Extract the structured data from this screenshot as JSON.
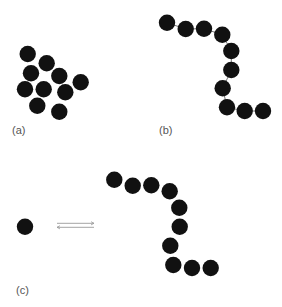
{
  "figure": {
    "panels": [
      {
        "id": "a",
        "label": "(a)",
        "label_pos": [
          12,
          124
        ],
        "description": "cluster of 10 particles",
        "particles": [
          [
            27.7,
            54
          ],
          [
            46.7,
            63.3
          ],
          [
            31,
            73.3
          ],
          [
            59.3,
            76
          ],
          [
            80.7,
            82.3
          ],
          [
            25,
            89.3
          ],
          [
            43.7,
            89.3
          ],
          [
            65.3,
            92.3
          ],
          [
            37.3,
            105.7
          ],
          [
            59.3,
            111.7
          ]
        ],
        "bonds": false
      },
      {
        "id": "b",
        "label": "(b)",
        "label_pos": [
          159,
          124
        ],
        "description": "chain of 10 linked particles",
        "particles": [
          [
            167,
            22.7
          ],
          [
            185.7,
            29
          ],
          [
            204,
            28.7
          ],
          [
            222.3,
            34.7
          ],
          [
            231.3,
            51
          ],
          [
            231.3,
            70
          ],
          [
            222.7,
            88.3
          ],
          [
            227,
            107.3
          ],
          [
            244.7,
            111
          ],
          [
            263,
            111
          ]
        ],
        "bonds": true
      },
      {
        "id": "c",
        "label": "(c)",
        "label_pos": [
          16,
          284
        ],
        "description": "single particle in equilibrium with a chain of 10 particles",
        "single_particle": [
          25,
          226.7
        ],
        "equilibrium_arrows": {
          "x1": 57,
          "x2": 94,
          "y_forward": 223.3,
          "y_reverse": 227.3
        },
        "particles": [
          [
            114.3,
            179.7
          ],
          [
            132.7,
            185.7
          ],
          [
            151.3,
            185.3
          ],
          [
            169.7,
            191.3
          ],
          [
            179.3,
            207.7
          ],
          [
            179.7,
            226.7
          ],
          [
            170.3,
            245.7
          ],
          [
            173.3,
            265
          ],
          [
            192,
            268
          ],
          [
            210.7,
            268
          ]
        ],
        "bonds": false
      }
    ],
    "particle_radius": 8.2,
    "particle_color": "#111111",
    "arrow_color": "#9a9a9a",
    "bond_color": "#777777"
  },
  "caption": {
    "text": ""
  }
}
